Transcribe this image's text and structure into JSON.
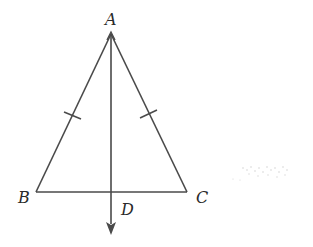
{
  "figure": {
    "points": {
      "A": {
        "label": "A"
      },
      "B": {
        "label": "B"
      },
      "C": {
        "label": "C"
      },
      "D": {
        "label": "D"
      }
    },
    "congruence_marks": [
      "AB",
      "AC"
    ],
    "ray": {
      "from": "A",
      "through": "D"
    },
    "stroke_color": "#4a4a4a"
  }
}
